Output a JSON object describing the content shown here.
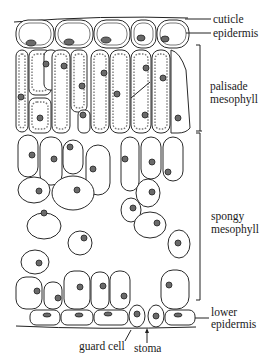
{
  "diagram": {
    "labels": {
      "cuticle": "cuticle",
      "epidermis": "epidermis",
      "palisade_line1": "palisade",
      "palisade_line2": "mesophyll",
      "spongy_line1": "spongy",
      "spongy_line2": "mesophyll",
      "lower_epidermis_line1": "lower",
      "lower_epidermis_line2": "epidermis",
      "guard_cell": "guard cell",
      "stoma": "stoma"
    },
    "colors": {
      "background": "#ffffff",
      "ink": "#2a2a2a",
      "nucleus": "#6a6a6a"
    }
  }
}
